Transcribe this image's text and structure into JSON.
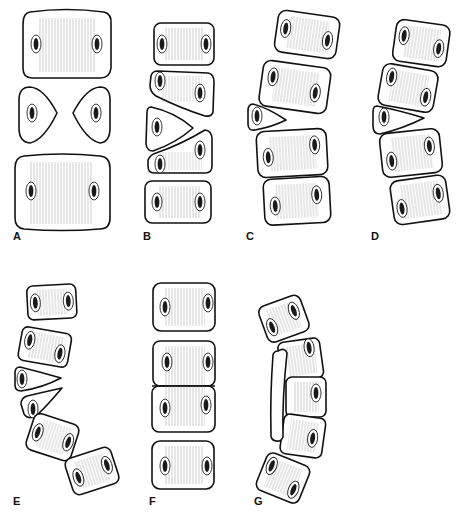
{
  "figure": {
    "panels": [
      {
        "id": "A",
        "label": "A",
        "description": "Bilateral hemivertebrae (butterfly-like) between two normal vertebral bodies"
      },
      {
        "id": "B",
        "label": "B",
        "description": "Wedge hemivertebrae, balanced, straight alignment"
      },
      {
        "id": "C",
        "label": "C",
        "description": "Single hemivertebra producing curve"
      },
      {
        "id": "D",
        "label": "D",
        "description": "Single wedged hemivertebra producing curve"
      },
      {
        "id": "E",
        "label": "E",
        "description": "Two adjacent unilateral hemivertebrae producing sharp curve"
      },
      {
        "id": "F",
        "label": "F",
        "description": "Block vertebra (bilateral failure of segmentation)"
      },
      {
        "id": "G",
        "label": "G",
        "description": "Unilateral unsegmented bar causing curvature"
      }
    ]
  },
  "colors": {
    "background": "#ffffff",
    "outline": "#111111",
    "hatching": "#555555"
  }
}
